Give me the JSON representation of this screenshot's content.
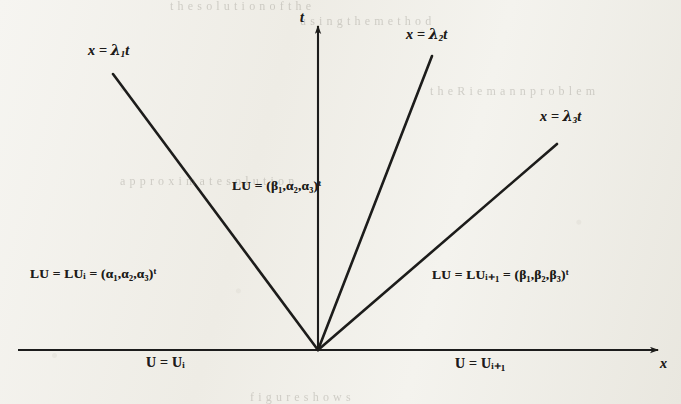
{
  "figure": {
    "background_color": "#f2f1ec",
    "ink_color": "#1d1c1a"
  },
  "axes": {
    "vertical_label": "t",
    "horizontal_label": "x",
    "origin": {
      "x": 318,
      "y": 350
    },
    "x_axis": {
      "start_x": 18,
      "end_x": 662,
      "y": 350
    },
    "t_axis": {
      "x": 318,
      "start_y": 348,
      "end_y": 22
    }
  },
  "rays": [
    {
      "name": "lambda-1",
      "label_lead": "x = ",
      "label_sym": "λ",
      "label_sub": "1",
      "label_tail": "t",
      "label_x": 88,
      "label_y": 44,
      "x1": 318,
      "y1": 350,
      "x2": 113,
      "y2": 74
    },
    {
      "name": "lambda-2",
      "label_lead": "x = ",
      "label_sym": "λ",
      "label_sub": "2",
      "label_tail": "t",
      "label_x": 406,
      "label_y": 28,
      "x1": 318,
      "y1": 350,
      "x2": 432,
      "y2": 56
    },
    {
      "name": "lambda-3",
      "label_lead": "x = ",
      "label_sym": "λ",
      "label_sub": "3",
      "label_tail": "t",
      "label_x": 540,
      "label_y": 110,
      "x1": 318,
      "y1": 350,
      "x2": 557,
      "y2": 144
    }
  ],
  "region_labels": [
    {
      "name": "state-left",
      "text": "LU = LUᵢ = (α₁,α₂,α₃)ᵗ",
      "x": 30,
      "y": 268
    },
    {
      "name": "state-middle",
      "text": "LU = (β₁,α₂,α₃)ᵗ",
      "x": 232,
      "y": 180
    },
    {
      "name": "state-right",
      "text": "LU = LUᵢ₊₁ = (β₁,β₂,β₃)ᵗ",
      "x": 432,
      "y": 268
    }
  ],
  "axis_states": [
    {
      "name": "axis-state-left",
      "text": "U = Uᵢ",
      "x": 146,
      "y": 357
    },
    {
      "name": "axis-state-right",
      "text": "U = Uᵢ₊₁",
      "x": 455,
      "y": 357
    }
  ],
  "ghost_text": [
    {
      "text": "t  h  e     s  o  l  u  t  i  o  n     o  f     t  h  e",
      "x": 170,
      "y": 2
    },
    {
      "text": "u  s  i  n  g     t  h  e     m  e  t  h  o  d",
      "x": 300,
      "y": 16
    },
    {
      "text": "t  h  e     R  i  e  m  a  n  n     p  r  o  b  l  e  m",
      "x": 430,
      "y": 86
    },
    {
      "text": "a  p  p  r  o  x  i  m  a  t  e     s  o  l  u  t  i  o  n",
      "x": 120,
      "y": 176
    },
    {
      "text": "f  i  g  u  r  e     s  h  o  w  s",
      "x": 250,
      "y": 392
    }
  ]
}
